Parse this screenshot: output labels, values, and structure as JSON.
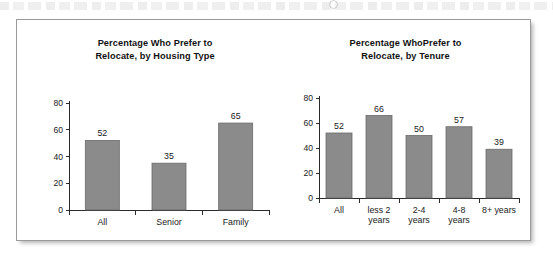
{
  "figure": {
    "background_color": "#ffffff",
    "border_color": "#9a9a9c",
    "bar_fill_color": "#8b8b8b",
    "bar_stroke_color": "#6a6a6a",
    "axis_color": "#2a2a2a",
    "text_color": "#1a1a1a"
  },
  "chart_data": [
    {
      "type": "bar",
      "title": "Percentage Who Prefer to Relocate, by Housing Type",
      "title_line1": "Percentage Who Prefer to",
      "title_line2": "Relocate, by Housing Type",
      "categories": [
        "All",
        "Senior",
        "Family"
      ],
      "category_lines": [
        [
          "All"
        ],
        [
          "Senior"
        ],
        [
          "Family"
        ]
      ],
      "values": [
        52,
        35,
        65
      ],
      "xlabel": "",
      "ylabel": "",
      "ylim": [
        0,
        80
      ],
      "yticks": [
        0,
        20,
        40,
        60,
        80
      ],
      "ytick_labels": [
        "0",
        "20",
        "40",
        "60",
        "80"
      ],
      "grid": false,
      "legend": false,
      "data_labels": [
        "52",
        "35",
        "65"
      ]
    },
    {
      "type": "bar",
      "title": "Percentage WhoPrefer to Relocate, by Tenure",
      "title_line1": "Percentage WhoPrefer to",
      "title_line2": "Relocate, by Tenure",
      "categories": [
        "All",
        "less 2 years",
        "2-4 years",
        "4-8 years",
        "8+ years"
      ],
      "category_lines": [
        [
          "All"
        ],
        [
          "less 2",
          "years"
        ],
        [
          "2-4",
          "years"
        ],
        [
          "4-8",
          "years"
        ],
        [
          "8+ years"
        ]
      ],
      "values": [
        52,
        66,
        50,
        57,
        39
      ],
      "xlabel": "",
      "ylabel": "",
      "ylim": [
        0,
        80
      ],
      "yticks": [
        0,
        20,
        40,
        60,
        80
      ],
      "ytick_labels": [
        "0",
        "20",
        "40",
        "60",
        "80"
      ],
      "grid": false,
      "legend": false,
      "data_labels": [
        "52",
        "66",
        "50",
        "57",
        "39"
      ]
    }
  ]
}
